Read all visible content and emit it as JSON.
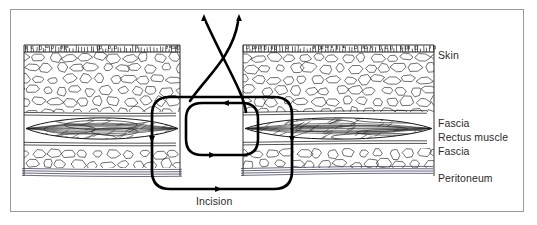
{
  "figure": {
    "kind": "medical-cross-section-illustration",
    "frame": {
      "border_color": "#9a9a9a",
      "background": "#ffffff",
      "x": 10,
      "y": 9,
      "width": 514,
      "height": 203
    }
  },
  "labels": {
    "skin": "Skin",
    "fascia_upper": "Fascia",
    "rectus_muscle": "Rectus muscle",
    "fascia_lower": "Fascia",
    "peritoneum": "Peritoneum",
    "incision": "Incision"
  },
  "ink": {
    "line_color": "#1a1a1a",
    "texture_color": "#222222",
    "suture_color": "#000000",
    "peritoneum_color": "#3a3a55",
    "label_color": "#2b2b2b"
  },
  "layers": [
    {
      "name": "epidermis",
      "label": "Skin",
      "top": 45,
      "bottom": 52,
      "texture": "tick-hatch"
    },
    {
      "name": "subcutaneous-fat",
      "label": "",
      "top": 52,
      "bottom": 112,
      "texture": "cobblestone"
    },
    {
      "name": "fascia-anterior",
      "label": "Fascia",
      "top": 112,
      "bottom": 118,
      "texture": "parallel-lines"
    },
    {
      "name": "rectus-muscle",
      "label": "Rectus muscle",
      "top": 115,
      "bottom": 142,
      "texture": "spindle-fibers"
    },
    {
      "name": "fascia-posterior",
      "label": "Fascia",
      "top": 142,
      "bottom": 148,
      "texture": "parallel-lines"
    },
    {
      "name": "preperitoneal-fat",
      "label": "",
      "top": 148,
      "bottom": 168,
      "texture": "cobblestone"
    },
    {
      "name": "peritoneum",
      "label": "Peritoneum",
      "top": 168,
      "bottom": 176,
      "texture": "parallel-lines"
    }
  ],
  "tissue_blocks": {
    "left": {
      "x": 24,
      "width": 156,
      "gap_edge": 180
    },
    "right": {
      "x": 243,
      "width": 191,
      "gap_edge": 243
    },
    "incision_gap": {
      "left": 180,
      "right": 243
    }
  },
  "suture": {
    "description": "Mass closure suture; two free ends exit through skin and cross, an inner small loop encircles the near fascial bite, an outer large loop passes deep around all layers",
    "thread_ends": [
      {
        "id": "left-end",
        "arrow_at": [
          204,
          14
        ],
        "direction": "up"
      },
      {
        "id": "right-end",
        "arrow_at": [
          239,
          14
        ],
        "direction": "up"
      }
    ],
    "inner_loop": {
      "x": 186,
      "y": 103,
      "width": 72,
      "height": 52,
      "radius": 16,
      "arrows": [
        {
          "at": [
            222,
            103
          ],
          "direction": "left"
        },
        {
          "at": [
            216,
            155
          ],
          "direction": "right"
        }
      ]
    },
    "outer_loop": {
      "x": 152,
      "y": 97,
      "width": 140,
      "height": 92,
      "radius": 18,
      "arrows": [
        {
          "at": [
            152,
            143
          ],
          "direction": "down"
        },
        {
          "at": [
            292,
            143
          ],
          "direction": "down"
        },
        {
          "at": [
            222,
            189
          ],
          "direction": "right"
        }
      ]
    }
  },
  "texture_params": {
    "cobblestone_cell_w": 15,
    "cobblestone_cell_h": 11,
    "tick_spacing": 3,
    "muscle_fiber_count": 22,
    "peritoneum_line_count": 4
  }
}
